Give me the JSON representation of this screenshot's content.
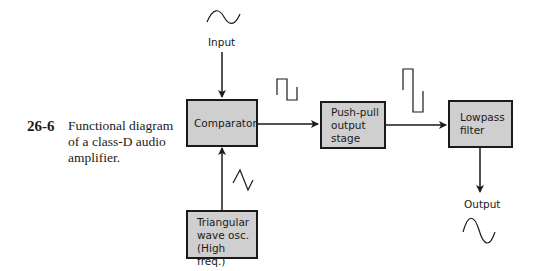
{
  "caption": {
    "number": "26-6",
    "text": "Functional diagram of a class-D audio amplifier."
  },
  "blocks": {
    "comparator": {
      "label": "Comparator"
    },
    "push_pull": {
      "label": "Push-pull\noutput\nstage"
    },
    "lowpass": {
      "label": "Lowpass\nfilter"
    },
    "oscillator": {
      "label": "Triangular\nwave osc.\n(High freq.)"
    }
  },
  "io": {
    "input_label": "Input",
    "output_label": "Output"
  },
  "waveforms": {
    "input": "sine-wave-icon",
    "oscillator": "triangle-wave-icon",
    "comparator_out": "pwm-square-wave-icon",
    "stage_out": "amplified-square-wave-icon",
    "output": "amplified-sine-wave-icon"
  },
  "colors": {
    "block_fill": "#cfcfcf",
    "stroke": "#1a1a1a",
    "background": "#ffffff"
  }
}
